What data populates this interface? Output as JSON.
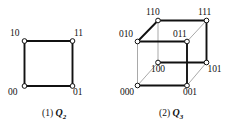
{
  "figure": {
    "background_color": "#ffffff",
    "ink_color": "#111111",
    "hidden_edge_color": "#9a9a9a",
    "node_fill": "#ffffff",
    "node_stroke": "#111111"
  },
  "panels": [
    {
      "id": "panel-q2",
      "caption_number": "(1)",
      "caption_symbol": "Q",
      "caption_subscript": "2",
      "caption_text": "(1) Q2",
      "graph_name": "hypercube-q2",
      "vertices": [
        {
          "label": "10",
          "cx": 24.5,
          "cy": 41.0,
          "label_x": 10.0,
          "label_y": 29.0
        },
        {
          "label": "11",
          "cx": 72.5,
          "cy": 41.0,
          "label_x": 74.0,
          "label_y": 29.0
        },
        {
          "label": "00",
          "cx": 24.5,
          "cy": 86.0,
          "label_x": 8.0,
          "label_y": 88.0
        },
        {
          "label": "01",
          "cx": 72.5,
          "cy": 86.0,
          "label_x": 73.0,
          "label_y": 88.0
        }
      ],
      "edges": [
        {
          "from": "10",
          "to": "11",
          "style": "solid"
        },
        {
          "from": "10",
          "to": "00",
          "style": "solid"
        },
        {
          "from": "11",
          "to": "01",
          "style": "solid"
        },
        {
          "from": "00",
          "to": "01",
          "style": "solid"
        }
      ]
    },
    {
      "id": "panel-q3",
      "caption_number": "(2)",
      "caption_symbol": "Q",
      "caption_subscript": "3",
      "caption_text": "(2) Q3",
      "graph_name": "hypercube-q3",
      "vertices": [
        {
          "label": "110",
          "cx": 158.0,
          "cy": 20.5,
          "label_x": 146.0,
          "label_y": 8.0
        },
        {
          "label": "111",
          "cx": 206.5,
          "cy": 20.5,
          "label_x": 198.0,
          "label_y": 8.0
        },
        {
          "label": "010",
          "cx": 137.5,
          "cy": 41.5,
          "label_x": 119.0,
          "label_y": 30.0
        },
        {
          "label": "011",
          "cx": 187.0,
          "cy": 41.5,
          "label_x": 173.0,
          "label_y": 30.0
        },
        {
          "label": "100",
          "cx": 158.0,
          "cy": 62.5,
          "label_x": 151.0,
          "label_y": 65.0
        },
        {
          "label": "101",
          "cx": 206.5,
          "cy": 62.5,
          "label_x": 207.5,
          "label_y": 65.0
        },
        {
          "label": "000",
          "cx": 137.5,
          "cy": 85.5,
          "label_x": 120.0,
          "label_y": 87.5
        },
        {
          "label": "001",
          "cx": 187.0,
          "cy": 85.5,
          "label_x": 183.0,
          "label_y": 87.5
        }
      ],
      "edges": [
        {
          "from": "110",
          "to": "111",
          "style": "solid"
        },
        {
          "from": "110",
          "to": "010",
          "style": "solid"
        },
        {
          "from": "110",
          "to": "100",
          "style": "light"
        },
        {
          "from": "111",
          "to": "011",
          "style": "light"
        },
        {
          "from": "111",
          "to": "101",
          "style": "solid"
        },
        {
          "from": "010",
          "to": "011",
          "style": "solid"
        },
        {
          "from": "010",
          "to": "000",
          "style": "light"
        },
        {
          "from": "011",
          "to": "001",
          "style": "solid"
        },
        {
          "from": "100",
          "to": "101",
          "style": "solid"
        },
        {
          "from": "100",
          "to": "000",
          "style": "light"
        },
        {
          "from": "101",
          "to": "001",
          "style": "light"
        },
        {
          "from": "000",
          "to": "001",
          "style": "solid"
        }
      ]
    }
  ],
  "captions": [
    {
      "id": "caption-q2",
      "number": "(1)",
      "symbol": "Q",
      "subscript": "2",
      "x": 42.0,
      "y": 108.0
    },
    {
      "id": "caption-q3",
      "number": "(2)",
      "symbol": "Q",
      "subscript": "3",
      "x": 159.0,
      "y": 108.0
    }
  ]
}
